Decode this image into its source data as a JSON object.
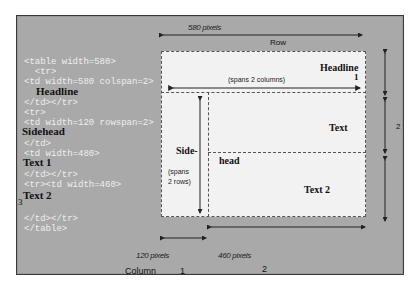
{
  "code_lines": [
    "<table width=580>",
    "  <tr>",
    "<td width=580 colspan=2>",
    "</td></tr>",
    "<tr>",
    "<td width=120 rowspan=2>",
    "</td>",
    "<td width=480>",
    "</td></tr>",
    "<tr><td width=460>",
    "</td></tr>",
    "</table>"
  ],
  "code_content_labels": {
    "headline": "Headline",
    "sidehead": "Sidehead",
    "text1": "Text 1",
    "text2": "Text   2",
    "stray_3": "3"
  },
  "diagram": {
    "top_width_label": "580 pixels",
    "row_label": "Row",
    "headline_cell": {
      "title": "Headline",
      "number": "1",
      "note": "(spans 2 columns)"
    },
    "sidehead_cell": {
      "title_part1": "Side-",
      "title_part2": "head",
      "note_line1": "(spans",
      "note_line2": "2 rows)"
    },
    "text_cell": {
      "title": "Text"
    },
    "text2_cell": {
      "title": "Text 2"
    },
    "row_number_right": "2",
    "col1_width_label": "120 pixels",
    "col2_width_label": "460 pixels",
    "column_label": "Column",
    "column_numbers": [
      "1",
      "2"
    ]
  },
  "colors": {
    "panel_bg": "#a9a9a9",
    "table_bg": "#f2f2f2",
    "code_text": "#eeeeee",
    "dark_text": "#111111"
  }
}
